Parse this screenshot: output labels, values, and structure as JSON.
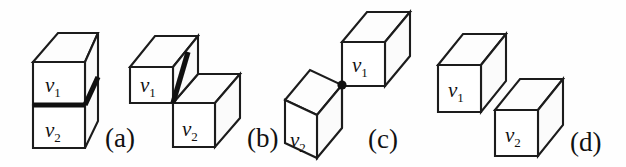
{
  "figure": {
    "background_color": "#fefefe",
    "stroke_color": "#1c1c1c",
    "bold_edge_color": "#101010",
    "face_color": "#ffffff",
    "width": 626,
    "height": 167
  },
  "panels": [
    {
      "id": "a",
      "caption": "(a)",
      "relation": "face-adjacent",
      "contact_type": "shared face",
      "voxels": [
        {
          "name": "v1",
          "symbol": "v",
          "subscript": "1"
        },
        {
          "name": "v2",
          "symbol": "v",
          "subscript": "2"
        }
      ]
    },
    {
      "id": "b",
      "caption": "(b)",
      "relation": "edge-adjacent",
      "contact_type": "shared edge",
      "voxels": [
        {
          "name": "v1",
          "symbol": "v",
          "subscript": "1"
        },
        {
          "name": "v2",
          "symbol": "v",
          "subscript": "2"
        }
      ]
    },
    {
      "id": "c",
      "caption": "(c)",
      "relation": "vertex-adjacent",
      "contact_type": "shared vertex",
      "voxels": [
        {
          "name": "v1",
          "symbol": "v",
          "subscript": "1"
        },
        {
          "name": "v2",
          "symbol": "v",
          "subscript": "2"
        }
      ]
    },
    {
      "id": "d",
      "caption": "(d)",
      "relation": "disjoint",
      "contact_type": "no contact",
      "voxels": [
        {
          "name": "v1",
          "symbol": "v",
          "subscript": "1"
        },
        {
          "name": "v2",
          "symbol": "v",
          "subscript": "2"
        }
      ]
    }
  ]
}
